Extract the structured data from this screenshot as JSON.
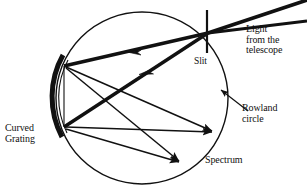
{
  "figure": {
    "background_color": "#ffffff",
    "ink_color": "#111111"
  },
  "labels": {
    "light_from_telescope": "Light\nfrom the\ntelescope",
    "slit": "Slit",
    "rowland_circle": "Rowland\ncircle",
    "curved_grating": "Curved\nGrating",
    "spectrum": "Spectrum"
  },
  "geometry": {
    "circle": {
      "name": "rowland-circle",
      "cx": 142,
      "cy": 98,
      "r": 86,
      "stroke_width": 1.4,
      "stroke": "#111111",
      "fill": "none"
    },
    "grating": {
      "name": "curved-grating",
      "description": "thick concave arc forming the left portion of the Rowland circle",
      "path": "M 62 58 A 86 86 0 0 0 61 134",
      "stroke_width": 4.6,
      "stroke": "#111111"
    },
    "slit": {
      "name": "slit",
      "x": 207,
      "y1": 10,
      "y2": 53,
      "stroke_width": 2.2,
      "stroke": "#111111"
    },
    "points": {
      "slit_point": [
        208,
        33
      ],
      "grating_upper": [
        63,
        66
      ],
      "grating_lower": [
        63,
        127
      ],
      "spectrum_upper": [
        216,
        133
      ],
      "spectrum_lower": [
        183,
        164
      ]
    },
    "incoming_rays": [
      {
        "name": "incoming-ray-upper",
        "x1": 307,
        "y1": 0,
        "x2": 208,
        "y2": 33,
        "stroke_width": 3.6
      },
      {
        "name": "incoming-ray-lower",
        "x1": 307,
        "y1": 20,
        "x2": 208,
        "y2": 33,
        "stroke_width": 3.2
      }
    ],
    "incident_rays": [
      {
        "name": "incident-ray-to-upper-grating",
        "x1": 208,
        "y1": 33,
        "x2": 63,
        "y2": 66,
        "stroke_width": 3.4,
        "arrow_t": 0.48
      },
      {
        "name": "incident-ray-to-lower-grating",
        "x1": 208,
        "y1": 33,
        "x2": 63,
        "y2": 127,
        "stroke_width": 3.4,
        "arrow_t": 0.46
      }
    ],
    "diffracted_rays": [
      {
        "name": "diffracted-ray-upper-to-spectrum-upper",
        "x1": 63,
        "y1": 66,
        "x2": 216,
        "y2": 133,
        "stroke_width": 1.5,
        "arrowhead": true
      },
      {
        "name": "diffracted-ray-upper-to-spectrum-lower",
        "x1": 63,
        "y1": 66,
        "x2": 183,
        "y2": 164,
        "stroke_width": 1.5,
        "arrowhead": true
      },
      {
        "name": "diffracted-ray-lower-to-spectrum-upper",
        "x1": 63,
        "y1": 127,
        "x2": 216,
        "y2": 133,
        "stroke_width": 1.5,
        "arrowhead": true
      },
      {
        "name": "diffracted-ray-lower-to-spectrum-lower",
        "x1": 63,
        "y1": 127,
        "x2": 183,
        "y2": 164,
        "stroke_width": 1.5,
        "arrowhead": true
      },
      {
        "name": "chord-upper-grating-to-lower-grating",
        "x1": 63,
        "y1": 66,
        "x2": 63,
        "y2": 127,
        "stroke_width": 1.2,
        "arrowhead": false
      }
    ],
    "leader_line": {
      "name": "rowland-circle-leader",
      "x1": 246,
      "y1": 110,
      "x2": 218,
      "y2": 88,
      "stroke_width": 1.2,
      "arrowhead": true
    }
  }
}
